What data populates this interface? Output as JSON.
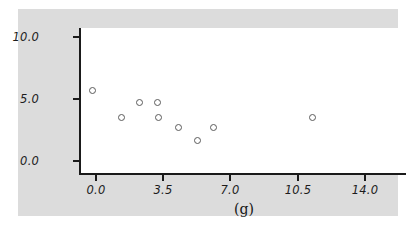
{
  "chart_data": {
    "type": "scatter",
    "title": "",
    "subtitle": "",
    "xlabel": "(g)",
    "ylabel": "",
    "xlim": [
      -0.85,
      16.3
    ],
    "ylim": [
      -0.95,
      11.8
    ],
    "x_ticks": [
      0.0,
      3.5,
      7.0,
      10.5,
      14.0
    ],
    "x_tick_labels": [
      "0.0",
      "3.5",
      "7.0",
      "10.5",
      "14.0"
    ],
    "y_ticks": [
      0.0,
      5.0,
      10.0
    ],
    "y_tick_labels": [
      "0.0",
      "5.0",
      "10.0"
    ],
    "grid": false,
    "legend": null,
    "marker": "open-circle",
    "marker_color": "#5b5b5b",
    "points": [
      {
        "x": 0.75,
        "y": 5.0
      },
      {
        "x": 2.25,
        "y": 2.8
      },
      {
        "x": 3.2,
        "y": 4.0
      },
      {
        "x": 4.1,
        "y": 4.0
      },
      {
        "x": 4.15,
        "y": 2.8
      },
      {
        "x": 5.2,
        "y": 2.0
      },
      {
        "x": 6.2,
        "y": 1.0
      },
      {
        "x": 7.05,
        "y": 2.0
      },
      {
        "x": 12.2,
        "y": 2.8
      }
    ],
    "series": [
      {
        "name": "data",
        "x": [
          0.75,
          2.25,
          3.2,
          4.1,
          4.15,
          5.2,
          6.2,
          7.05,
          12.2
        ],
        "values": [
          5.0,
          2.8,
          4.0,
          4.0,
          2.8,
          2.0,
          1.0,
          2.0,
          2.8
        ]
      }
    ],
    "colors": {
      "figure_background": "#dcdcdc",
      "plot_background": "#ffffff",
      "axis": "#1a1a1a",
      "text": "#1c1c1c",
      "marker": "#5b5b5b"
    }
  }
}
